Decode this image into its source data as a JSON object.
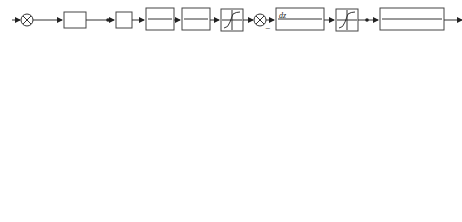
{
  "diagram": {
    "type": "control-system-block-diagram",
    "signals": {
      "q": "q",
      "q_r_top": "q",
      "q_r_sub": "r",
      "I": "I",
      "U": "U",
      "delta_I": "ΔI",
      "M_dz": "M",
      "M_dz_sub": "dz",
      "M_dz_pp": "M\"",
      "M_dz_p": "M'",
      "delta_p": "δ'",
      "delta": "δ",
      "theta_D": "θ",
      "theta_D_sub": "D",
      "n": "n",
      "phi": "φ",
      "qr_lower": "q",
      "qr_lower_sub": "r",
      "vartheta": "ϑ",
      "q_lower": "q",
      "theta_M": "θ",
      "theta_M_sub": "M"
    },
    "blocks": {
      "k4": "K₄",
      "hs_num": "1",
      "hs_den": "Hs",
      "kg": "K",
      "kg_sub": "g",
      "kphi": "K",
      "kphi_sub": "φ",
      "r1": "R",
      "r1_sub": "1",
      "k1_num": "K₁",
      "k1_den": "T₁s+1",
      "kmc_num": "K",
      "kmc_sub": "MC",
      "kmc_den": "τs+1",
      "deadzone": "saturation",
      "hyst_k": "K",
      "hyst_b": "B",
      "kdz_num": "K",
      "kdz_num_rest": "(τs+1)",
      "kdz_den": "s",
      "sat2": "saturation",
      "kd_num": "K",
      "kd_num_sub": "d",
      "kd_den": "T²ₐs²+2Tₐξₐs+1",
      "vd_num": "v",
      "vd_den": "57.3g",
      "mi_top": "M",
      "mi_top_sub": "i",
      "mi_bot": "M",
      "mi_bot_sub": "i",
      "kd2_num": "K",
      "kd2_den": "T²ₐs²+2Tₐξₐs+1",
      "t1d_num": "T₁ₐs+1",
      "t1d_den": "s",
      "vdr_num": "v̄",
      "vdr_den": "R(t)s",
      "int_num": "1",
      "int_den": "s",
      "vm_num": "v̄",
      "vm_den": "v"
    },
    "summing_junction_signs": {
      "sj1": [
        "+",
        "−"
      ],
      "sj2": [
        "+",
        "−"
      ],
      "sj3": [
        "+",
        "−"
      ],
      "sj4": [
        "−",
        "+"
      ],
      "sj5": [
        "+",
        "+"
      ],
      "sj6": [
        "+",
        "−"
      ],
      "sj7": [
        "−",
        "+"
      ]
    }
  }
}
